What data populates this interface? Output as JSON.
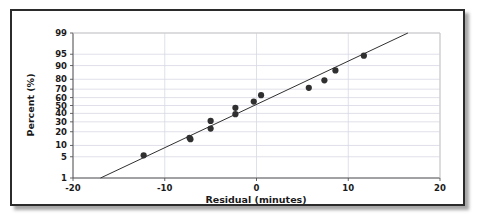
{
  "figure": {
    "kind": "normal-probability-plot",
    "frame_color": "#2b2b2b",
    "background_color": "#ffffff"
  },
  "chart_data": {
    "type": "scatter",
    "title": "",
    "subtitle": "",
    "xlabel": "Residual (minutes)",
    "ylabel": "Percent (%)",
    "xlim": [
      -20,
      20
    ],
    "ylim": [
      1,
      99
    ],
    "y_scale": "normal-probability",
    "grid": true,
    "legend_position": "none",
    "x_ticks": [
      -20,
      -10,
      0,
      10,
      20
    ],
    "x_tick_labels": [
      "-20",
      "-10",
      "0",
      "10",
      "20"
    ],
    "y_ticks": [
      1,
      5,
      10,
      20,
      30,
      40,
      50,
      60,
      70,
      80,
      90,
      95,
      99
    ],
    "y_tick_labels": [
      "1",
      "5",
      "10",
      "20",
      "30",
      "40",
      "50",
      "60",
      "70",
      "80",
      "90",
      "95",
      "99"
    ],
    "marker_color": "#303030",
    "marker_size": 3.1,
    "line_color": "#303030",
    "line_width": 1.0,
    "series": [
      {
        "name": "Residual percentiles",
        "type": "scatter",
        "x": [
          -12.3,
          -7.2,
          -7.3,
          -5.0,
          -5.0,
          -2.3,
          -2.3,
          -0.3,
          0.5,
          5.7,
          7.4,
          8.6,
          11.7
        ],
        "y": [
          5.5,
          14.0,
          15.0,
          23.0,
          31.0,
          39.0,
          47.0,
          55.0,
          63.0,
          71.5,
          79.0,
          87.0,
          94.5
        ]
      },
      {
        "name": "Reference line",
        "type": "line",
        "x": [
          -17.0,
          16.5
        ],
        "y": [
          1.0,
          99.0
        ]
      }
    ]
  }
}
